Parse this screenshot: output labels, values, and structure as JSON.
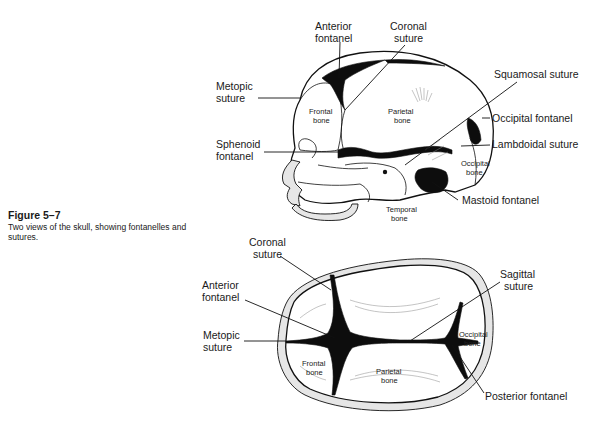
{
  "caption": {
    "figure_number": "Figure 5–7",
    "description": "Two views of the skull, showing fontanelles and sutures."
  },
  "lateral_view": {
    "labels": {
      "anterior_fontanel": [
        "Anterior",
        "fontanel"
      ],
      "coronal_suture": [
        "Coronal",
        "suture"
      ],
      "metopic_suture": [
        "Metopic",
        "suture"
      ],
      "squamosal_suture": "Squamosal suture",
      "occipital_fontanel": "Occipital fontanel",
      "sphenoid_fontanel": [
        "Sphenoid",
        "fontanel"
      ],
      "lambdoidal_suture": "Lambdoidal suture",
      "mastoid_fontanel": "Mastoid fontanel"
    },
    "bone_labels": {
      "frontal": [
        "Frontal",
        "bone"
      ],
      "parietal": [
        "Parietal",
        "bone"
      ],
      "occipital": [
        "Occipital",
        "bone"
      ],
      "temporal": [
        "Temporal",
        "bone"
      ]
    }
  },
  "superior_view": {
    "labels": {
      "coronal_suture": [
        "Coronal",
        "suture"
      ],
      "anterior_fontanel": [
        "Anterior",
        "fontanel"
      ],
      "metopic_suture": [
        "Metopic",
        "suture"
      ],
      "sagittal_suture": [
        "Sagittal",
        "suture"
      ],
      "posterior_fontanel": "Posterior fontanel"
    },
    "bone_labels": {
      "frontal": [
        "Frontal",
        "bone"
      ],
      "parietal": [
        "Parietal",
        "bone"
      ],
      "occipital": [
        "Occipital",
        "bone"
      ]
    }
  }
}
